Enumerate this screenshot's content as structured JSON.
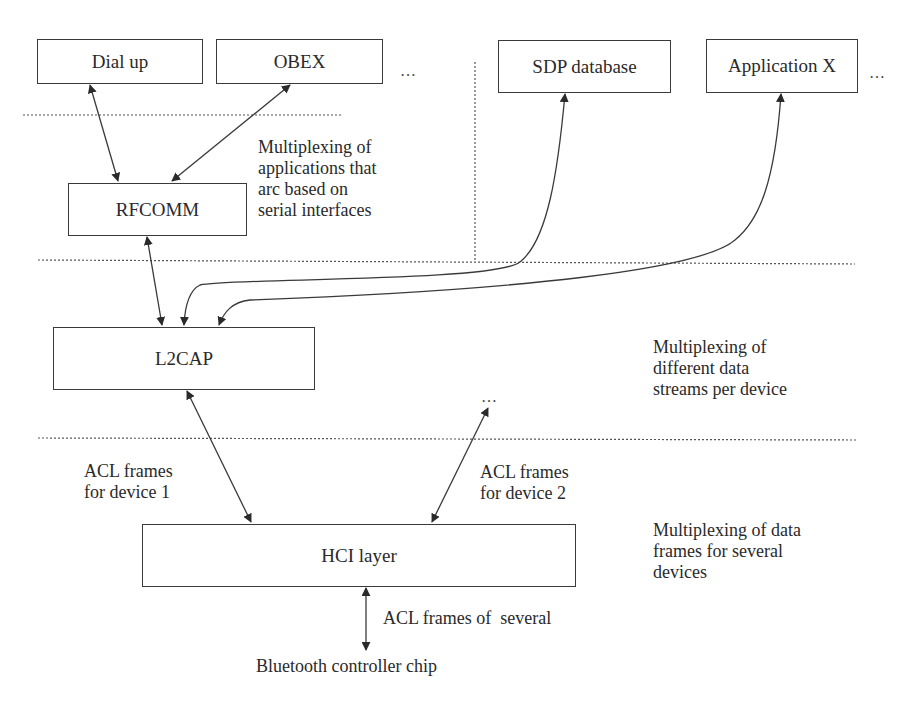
{
  "diagram": {
    "boxes": {
      "dial_up": "Dial up",
      "obex": "OBEX",
      "sdp_database": "SDP database",
      "application_x": "Application X",
      "rfcomm": "RFCOMM",
      "l2cap": "L2CAP",
      "hci_layer": "HCI layer"
    },
    "ellipses": {
      "after_obex": "…",
      "after_application_x": "…",
      "above_device2": "…"
    },
    "annotations": {
      "rfcomm_mux": "Multiplexing of\napplications that\narc based on\nserial interfaces",
      "l2cap_mux": "Multiplexing of\ndifferent data\nstreams per device",
      "hci_mux": "Multiplexing of data\nframes for several\ndevices",
      "acl_device1": "ACL frames\nfor device 1",
      "acl_device2": "ACL frames\nfor device 2",
      "acl_several": "ACL frames of  several",
      "controller_chip": "Bluetooth controller chip"
    },
    "colors": {
      "line": "#3a3a3a",
      "dotted": "#555555",
      "text": "#2a2a2a"
    }
  }
}
